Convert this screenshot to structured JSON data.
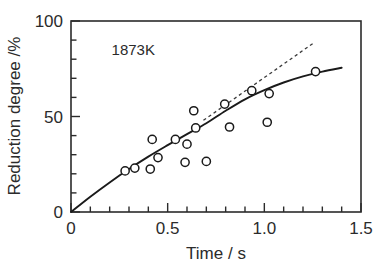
{
  "chart_data": {
    "type": "scatter",
    "title": "",
    "xlabel": "Time / s",
    "ylabel": "Reduction degree /%",
    "xlim": [
      0,
      1.5
    ],
    "ylim": [
      0,
      100
    ],
    "xticks": [
      0,
      0.5,
      1.0,
      1.5
    ],
    "xtick_labels": [
      "0",
      "0.5",
      "1.0",
      "1.5"
    ],
    "xminor_step": 0.1,
    "yticks": [
      0,
      50,
      100
    ],
    "ytick_labels": [
      "0",
      "50",
      "100"
    ],
    "yminor_step": 10,
    "grid": false,
    "legend": null,
    "annotations": [
      {
        "text": "1873K",
        "x": 0.21,
        "y": 82
      }
    ],
    "series": [
      {
        "name": "Measured reduction degree",
        "type": "scatter",
        "marker": "open-circle",
        "color": "#1a1a1a",
        "points": [
          {
            "x": 0.28,
            "y": 21.5
          },
          {
            "x": 0.33,
            "y": 23.0
          },
          {
            "x": 0.41,
            "y": 22.5
          },
          {
            "x": 0.42,
            "y": 38.0
          },
          {
            "x": 0.45,
            "y": 28.5
          },
          {
            "x": 0.54,
            "y": 38.0
          },
          {
            "x": 0.59,
            "y": 26.0
          },
          {
            "x": 0.6,
            "y": 35.5
          },
          {
            "x": 0.635,
            "y": 53.0
          },
          {
            "x": 0.645,
            "y": 44.0
          },
          {
            "x": 0.7,
            "y": 26.5
          },
          {
            "x": 0.795,
            "y": 56.5
          },
          {
            "x": 0.82,
            "y": 44.5
          },
          {
            "x": 0.935,
            "y": 63.5
          },
          {
            "x": 1.015,
            "y": 47.0
          },
          {
            "x": 1.025,
            "y": 62.0
          },
          {
            "x": 1.265,
            "y": 73.5
          }
        ]
      },
      {
        "name": "Fitted reduction curve",
        "type": "line",
        "style": "solid",
        "color": "#1a1a1a",
        "points": [
          {
            "x": 0.0,
            "y": 0.0
          },
          {
            "x": 0.1,
            "y": 8.0
          },
          {
            "x": 0.2,
            "y": 15.5
          },
          {
            "x": 0.3,
            "y": 22.5
          },
          {
            "x": 0.4,
            "y": 29.0
          },
          {
            "x": 0.5,
            "y": 35.0
          },
          {
            "x": 0.6,
            "y": 40.8
          },
          {
            "x": 0.7,
            "y": 46.5
          },
          {
            "x": 0.8,
            "y": 53.0
          },
          {
            "x": 0.9,
            "y": 59.0
          },
          {
            "x": 1.0,
            "y": 63.8
          },
          {
            "x": 1.1,
            "y": 67.8
          },
          {
            "x": 1.2,
            "y": 71.0
          },
          {
            "x": 1.3,
            "y": 73.5
          },
          {
            "x": 1.4,
            "y": 75.5
          }
        ]
      },
      {
        "name": "Tangent extrapolation",
        "type": "line",
        "style": "dashed",
        "color": "#3a3a3a",
        "points": [
          {
            "x": 0.685,
            "y": 48.0
          },
          {
            "x": 1.255,
            "y": 88.5
          }
        ]
      }
    ]
  },
  "axes": {
    "x_title": "Time / s",
    "y_title": "Reduction degree /%"
  }
}
